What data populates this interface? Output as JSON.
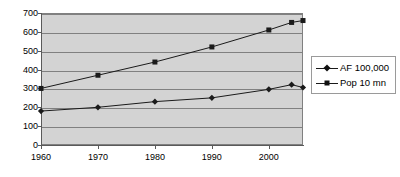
{
  "chart_data": {
    "type": "line",
    "title": "",
    "subtitle": "",
    "xlabel": "",
    "ylabel": "",
    "x": [
      1960,
      1970,
      1980,
      1990,
      2000,
      2005
    ],
    "x_tick_labels": [
      "1960",
      "1970",
      "1980",
      "1990",
      "2000"
    ],
    "x_ticks": [
      1960,
      1970,
      1980,
      1990,
      2000
    ],
    "xlim": [
      1960,
      2006
    ],
    "ylim": [
      0,
      700
    ],
    "y_ticks": [
      0,
      100,
      200,
      300,
      400,
      500,
      600,
      700
    ],
    "y_tick_labels": [
      "0",
      "100",
      "200",
      "300",
      "400",
      "500",
      "600",
      "700"
    ],
    "grid": true,
    "grid_axis": "y",
    "legend_position": "right",
    "plot_background": "#d3d3d3",
    "series": [
      {
        "name": "AF 100,000",
        "marker": "diamond",
        "color": "#1a1a1a",
        "x": [
          1960,
          1970,
          1980,
          1990,
          2000,
          2004,
          2006
        ],
        "values": [
          180,
          200,
          230,
          250,
          295,
          320,
          305
        ]
      },
      {
        "name": "Pop 10 mn",
        "marker": "square",
        "color": "#1a1a1a",
        "x": [
          1960,
          1970,
          1980,
          1990,
          2000,
          2004,
          2006
        ],
        "values": [
          300,
          370,
          440,
          520,
          610,
          650,
          660
        ]
      }
    ]
  },
  "legend": {
    "entries": [
      {
        "label": "AF 100,000",
        "marker": "diamond"
      },
      {
        "label": "Pop 10 mn",
        "marker": "square"
      }
    ]
  }
}
